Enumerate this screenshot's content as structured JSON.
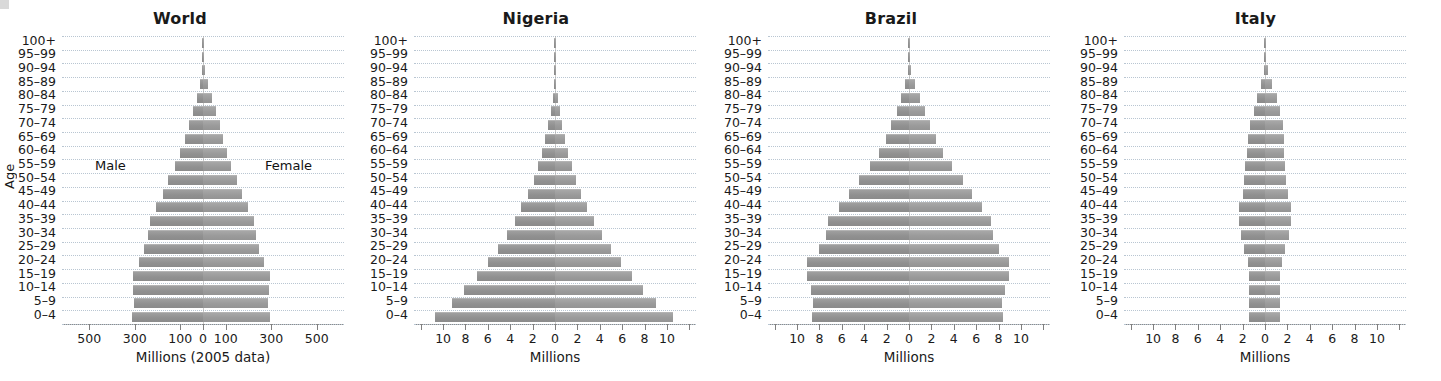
{
  "figure": {
    "age_axis_label": "Age",
    "age_groups": [
      "100+",
      "95–99",
      "90–94",
      "85–89",
      "80–84",
      "75–79",
      "70–74",
      "65–69",
      "60–64",
      "55–59",
      "50–54",
      "45–49",
      "40–44",
      "35–39",
      "30–34",
      "25–29",
      "20–24",
      "15–19",
      "10–14",
      "5–9",
      "0–4"
    ],
    "male_label": "Male",
    "female_label": "Female",
    "bar_color": "#9a9a9a",
    "grid_color": "#b9c6d2",
    "axis_color": "#8c8c8c"
  },
  "chart_data": [
    {
      "type": "bar",
      "title": "World",
      "subtype": "population-pyramid",
      "xlabel": "Millions (2005 data)",
      "ylabel": "Age",
      "categories": [
        "0–4",
        "5–9",
        "10–14",
        "15–19",
        "20–24",
        "25–29",
        "30–34",
        "35–39",
        "40–44",
        "45–49",
        "50–54",
        "55–59",
        "60–64",
        "65–69",
        "70–74",
        "75–79",
        "80–84",
        "85–89",
        "90–94",
        "95–99",
        "100+"
      ],
      "xticks": [
        -500,
        -300,
        -100,
        0,
        100,
        300,
        500
      ],
      "xticklabels": [
        "500",
        "300",
        "100",
        "0",
        "100",
        "300",
        "500"
      ],
      "xlim": [
        -620,
        620
      ],
      "grid": true,
      "units": "millions",
      "series": [
        {
          "name": "Male",
          "values": [
            311,
            303,
            308,
            310,
            282,
            258,
            244,
            234,
            205,
            175,
            152,
            123,
            100,
            80,
            63,
            46,
            28,
            14,
            5,
            1.2,
            0.2
          ]
        },
        {
          "name": "Female",
          "values": [
            293,
            287,
            292,
            293,
            268,
            247,
            235,
            226,
            199,
            171,
            150,
            124,
            104,
            87,
            73,
            58,
            40,
            23,
            10,
            3,
            0.6
          ]
        }
      ]
    },
    {
      "type": "bar",
      "title": "Nigeria",
      "subtype": "population-pyramid",
      "xlabel": "Millions",
      "ylabel": "Age",
      "categories": [
        "0–4",
        "5–9",
        "10–14",
        "15–19",
        "20–24",
        "25–29",
        "30–34",
        "35–39",
        "40–44",
        "45–49",
        "50–54",
        "55–59",
        "60–64",
        "65–69",
        "70–74",
        "75–79",
        "80–84",
        "85–89",
        "90–94",
        "95–99",
        "100+"
      ],
      "xticks": [
        -10,
        -8,
        -6,
        -4,
        -2,
        0,
        2,
        4,
        6,
        8,
        10
      ],
      "xticklabels": [
        "10",
        "8",
        "6",
        "4",
        "2",
        "0",
        "2",
        "4",
        "6",
        "8",
        "10"
      ],
      "xlim": [
        -12.6,
        12.6
      ],
      "grid": true,
      "units": "millions",
      "series": [
        {
          "name": "Male",
          "values": [
            10.7,
            9.2,
            8.1,
            7.0,
            6.0,
            5.1,
            4.3,
            3.6,
            3.0,
            2.4,
            1.9,
            1.5,
            1.15,
            0.85,
            0.6,
            0.38,
            0.22,
            0.1,
            0.04,
            0.012,
            0.003
          ]
        },
        {
          "name": "Female",
          "values": [
            10.5,
            9.0,
            7.9,
            6.9,
            5.9,
            5.0,
            4.2,
            3.5,
            2.9,
            2.35,
            1.9,
            1.5,
            1.2,
            0.9,
            0.65,
            0.42,
            0.25,
            0.12,
            0.05,
            0.015,
            0.004
          ]
        }
      ]
    },
    {
      "type": "bar",
      "title": "Brazil",
      "subtype": "population-pyramid",
      "xlabel": "Millions",
      "ylabel": "Age",
      "categories": [
        "0–4",
        "5–9",
        "10–14",
        "15–19",
        "20–24",
        "25–29",
        "30–34",
        "35–39",
        "40–44",
        "45–49",
        "50–54",
        "55–59",
        "60–64",
        "65–69",
        "70–74",
        "75–79",
        "80–84",
        "85–89",
        "90–94",
        "95–99",
        "100+"
      ],
      "xticks": [
        -10,
        -8,
        -6,
        -4,
        -2,
        0,
        2,
        4,
        6,
        8,
        10
      ],
      "xticklabels": [
        "10",
        "8",
        "6",
        "4",
        "2",
        "0",
        "2",
        "4",
        "6",
        "8",
        "10"
      ],
      "xlim": [
        -12.6,
        12.6
      ],
      "grid": true,
      "units": "millions",
      "series": [
        {
          "name": "Male",
          "values": [
            8.7,
            8.6,
            8.8,
            9.1,
            9.1,
            8.0,
            7.4,
            7.2,
            6.3,
            5.4,
            4.5,
            3.5,
            2.7,
            2.1,
            1.6,
            1.1,
            0.7,
            0.35,
            0.13,
            0.03,
            0.006
          ]
        },
        {
          "name": "Female",
          "values": [
            8.4,
            8.3,
            8.6,
            8.9,
            8.9,
            8.0,
            7.5,
            7.3,
            6.5,
            5.6,
            4.8,
            3.8,
            3.0,
            2.4,
            1.9,
            1.4,
            0.95,
            0.5,
            0.2,
            0.05,
            0.01
          ]
        }
      ]
    },
    {
      "type": "bar",
      "title": "Italy",
      "subtype": "population-pyramid",
      "xlabel": "Millions",
      "ylabel": "Age",
      "categories": [
        "0–4",
        "5–9",
        "10–14",
        "15–19",
        "20–24",
        "25–29",
        "30–34",
        "35–39",
        "40–44",
        "45–49",
        "50–54",
        "55–59",
        "60–64",
        "65–69",
        "70–74",
        "75–79",
        "80–84",
        "85–89",
        "90–94",
        "95–99",
        "100+"
      ],
      "xticks": [
        -10,
        -8,
        -6,
        -4,
        -2,
        0,
        2,
        4,
        6,
        8,
        10
      ],
      "xticklabels": [
        "10",
        "8",
        "6",
        "4",
        "2",
        "0",
        "2",
        "4",
        "6",
        "8",
        "10"
      ],
      "xlim": [
        -12.6,
        12.6
      ],
      "grid": true,
      "units": "millions",
      "series": [
        {
          "name": "Male",
          "values": [
            1.4,
            1.4,
            1.42,
            1.45,
            1.55,
            1.85,
            2.15,
            2.35,
            2.3,
            2.0,
            1.85,
            1.75,
            1.6,
            1.55,
            1.35,
            1.0,
            0.72,
            0.35,
            0.12,
            0.025,
            0.004
          ]
        },
        {
          "name": "Female",
          "values": [
            1.33,
            1.33,
            1.35,
            1.38,
            1.5,
            1.8,
            2.12,
            2.35,
            2.3,
            2.02,
            1.9,
            1.82,
            1.7,
            1.7,
            1.6,
            1.35,
            1.1,
            0.62,
            0.25,
            0.06,
            0.012
          ]
        }
      ]
    }
  ],
  "panels_layout": [
    {
      "left": 0,
      "width": 360,
      "plot_left": 62,
      "plot_width": 282,
      "age_col_left": 8,
      "show_age_axis_label": true,
      "show_sex_labels": true
    },
    {
      "left": 360,
      "width": 352,
      "plot_left": 54,
      "plot_width": 282,
      "age_col_left": 0,
      "show_age_axis_label": false,
      "show_sex_labels": false
    },
    {
      "left": 712,
      "width": 358,
      "plot_left": 56,
      "plot_width": 282,
      "age_col_left": 2,
      "show_age_axis_label": false,
      "show_sex_labels": false
    },
    {
      "left": 1070,
      "width": 371,
      "plot_left": 54,
      "plot_width": 282,
      "age_col_left": 0,
      "show_age_axis_label": false,
      "show_sex_labels": false
    }
  ]
}
